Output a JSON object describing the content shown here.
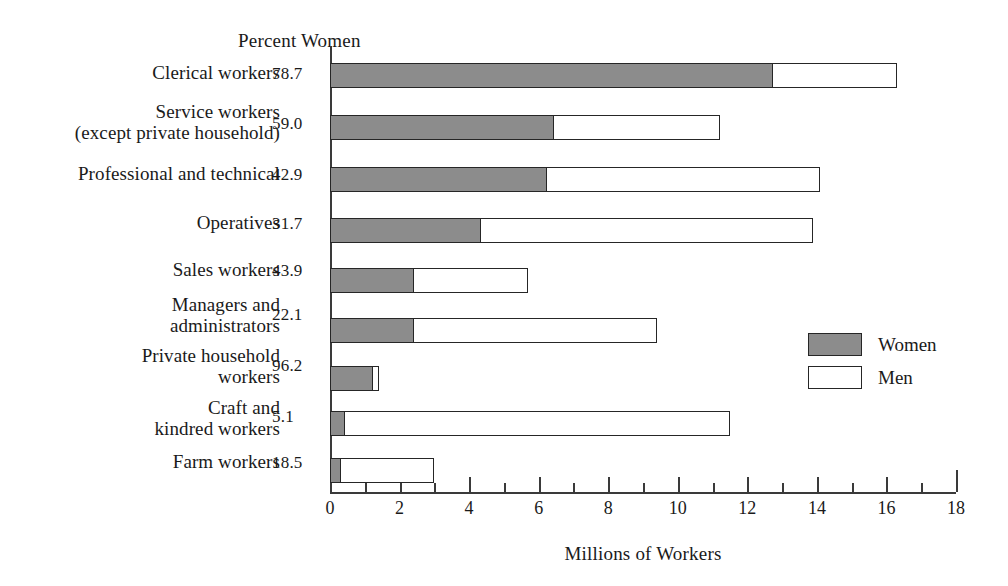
{
  "chart_data": {
    "type": "bar",
    "orientation": "horizontal",
    "stacked": true,
    "title": "",
    "header_label": "Percent Women",
    "xlabel": "Millions of Workers",
    "ylabel": "",
    "xlim": [
      0,
      18
    ],
    "xticks": [
      0,
      2,
      4,
      6,
      8,
      10,
      12,
      14,
      16,
      18
    ],
    "xtick_labels": [
      "0",
      "2",
      "4",
      "6",
      "8",
      "10",
      "12",
      "14",
      "16",
      "18"
    ],
    "minor_xticks": [
      1,
      3,
      5,
      7,
      9,
      11,
      13,
      15,
      17
    ],
    "grid": false,
    "legend": {
      "position": "right-middle",
      "entries": [
        {
          "name": "Women",
          "color": "#8c8c8c"
        },
        {
          "name": "Men",
          "color": "#ffffff"
        }
      ]
    },
    "categories": [
      "Clerical workers",
      "Service workers\n(except private household)",
      "Professional and technical",
      "Operatives",
      "Sales workers",
      "Managers and\nadministrators",
      "Private household\nworkers",
      "Craft and\nkindred workers",
      "Farm workers"
    ],
    "percent_women_labels": [
      "78.7",
      "59.0",
      "42.9",
      "31.7",
      "43.9",
      "22.1",
      "96.2",
      "5.1",
      "18.5"
    ],
    "percent_women": [
      78.7,
      59.0,
      42.9,
      31.7,
      43.9,
      22.1,
      96.2,
      5.1,
      18.5
    ],
    "series": [
      {
        "name": "Women",
        "color": "#8c8c8c",
        "values": [
          12.7,
          6.4,
          6.2,
          4.3,
          2.4,
          2.4,
          1.2,
          0.4,
          0.3
        ]
      },
      {
        "name": "Men",
        "color": "#ffffff",
        "values": [
          3.6,
          4.8,
          7.9,
          9.6,
          3.3,
          7.0,
          0.2,
          11.1,
          2.7
        ]
      }
    ],
    "totals": [
      16.3,
      11.2,
      14.1,
      13.9,
      5.7,
      9.4,
      1.4,
      11.5,
      3.0
    ]
  },
  "rows": [
    {
      "label": "Clerical workers",
      "value": "78.7"
    },
    {
      "label": "Service workers\n(except private household)",
      "value": "59.0"
    },
    {
      "label": "Professional and technical",
      "value": "42.9"
    },
    {
      "label": "Operatives",
      "value": "31.7"
    },
    {
      "label": "Sales workers",
      "value": "43.9"
    },
    {
      "label": "Managers and\nadministrators",
      "value": "22.1"
    },
    {
      "label": "Private household\nworkers",
      "value": "96.2"
    },
    {
      "label": "Craft and\nkindred workers",
      "value": "5.1"
    },
    {
      "label": "Farm workers",
      "value": "18.5"
    }
  ],
  "header": {
    "percent_women": "Percent Women"
  },
  "axis": {
    "x_title": "Millions of Workers",
    "labels": [
      "0",
      "2",
      "4",
      "6",
      "8",
      "10",
      "12",
      "14",
      "16",
      "18"
    ]
  },
  "legend": {
    "women_label": "Women",
    "men_label": "Men"
  }
}
